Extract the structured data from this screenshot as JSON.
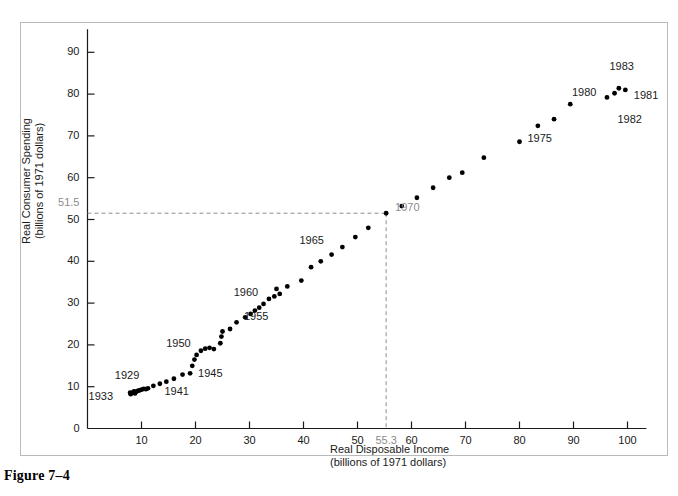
{
  "figure": {
    "caption": "Figure 7–4"
  },
  "axes": {
    "y_title_line1": "Real Consumer Spending",
    "y_title_line2": "(billions of 1971 dollars)",
    "x_title_line1": "Real Disposable Income",
    "x_title_line2": "(billions of 1971 dollars)",
    "y_ticks": [
      "0",
      "10",
      "20",
      "30",
      "40",
      "50",
      "60",
      "70",
      "80",
      "90"
    ],
    "x_ticks": [
      "10",
      "20",
      "30",
      "40",
      "50",
      "60",
      "70",
      "80",
      "90",
      "100"
    ]
  },
  "highlight": {
    "y_value_label": "51.5",
    "x_value_label": "55.3",
    "point_label": "1970",
    "color": "#8c8c8c"
  },
  "point_labels": {
    "y1929": "1929",
    "y1933": "1933",
    "y1941": "1941",
    "y1945": "1945",
    "y1950": "1950",
    "y1955": "1955",
    "y1960": "1960",
    "y1965": "1965",
    "y1975": "1975",
    "y1980": "1980",
    "y1981": "1981",
    "y1982": "1982",
    "y1983": "1983"
  },
  "chart_data": {
    "type": "scatter",
    "title": "Figure 7–4",
    "xlabel": "Real Disposable Income (billions of 1971 dollars)",
    "ylabel": "Real Consumer Spending (billions of 1971 dollars)",
    "xlim": [
      0,
      104
    ],
    "ylim": [
      0,
      95
    ],
    "grid": false,
    "legend": false,
    "marker_color": "#000000",
    "annotations": [
      {
        "text": "1929",
        "x": 9.5,
        "y": 9.2
      },
      {
        "text": "1933",
        "x": 7.6,
        "y": 7.3
      },
      {
        "text": "1941",
        "x": 13.5,
        "y": 10.8
      },
      {
        "text": "1945",
        "x": 19.0,
        "y": 14.0
      },
      {
        "text": "1950",
        "x": 20.5,
        "y": 19.5
      },
      {
        "text": "1955",
        "x": 27.5,
        "y": 26.5
      },
      {
        "text": "1960",
        "x": 33.0,
        "y": 31.5
      },
      {
        "text": "1965",
        "x": 40.0,
        "y": 41.5
      },
      {
        "text": "1970",
        "x": 55.3,
        "y": 51.5
      },
      {
        "text": "1975",
        "x": 80.0,
        "y": 68.5
      },
      {
        "text": "1980",
        "x": 96.0,
        "y": 79.5
      },
      {
        "text": "1981",
        "x": 99.5,
        "y": 80.0
      },
      {
        "text": "1982",
        "x": 98.5,
        "y": 77.0
      },
      {
        "text": "1983",
        "x": 98.5,
        "y": 83.0
      }
    ],
    "reference_lines": [
      {
        "axis": "y",
        "value": 51.5,
        "label": "51.5",
        "style": "dashed"
      },
      {
        "axis": "x",
        "value": 55.3,
        "label": "55.3",
        "style": "dashed"
      }
    ],
    "points": [
      {
        "x": 8.6,
        "y": 8.9
      },
      {
        "x": 9.0,
        "y": 8.8
      },
      {
        "x": 8.3,
        "y": 8.5
      },
      {
        "x": 8.0,
        "y": 8.2
      },
      {
        "x": 7.9,
        "y": 8.6
      },
      {
        "x": 8.8,
        "y": 8.4
      },
      {
        "x": 9.3,
        "y": 9.0
      },
      {
        "x": 9.6,
        "y": 9.1
      },
      {
        "x": 10.0,
        "y": 9.3
      },
      {
        "x": 10.4,
        "y": 9.5
      },
      {
        "x": 10.8,
        "y": 9.4
      },
      {
        "x": 11.2,
        "y": 9.6
      },
      {
        "x": 12.2,
        "y": 10.2
      },
      {
        "x": 13.4,
        "y": 10.7
      },
      {
        "x": 14.6,
        "y": 11.2
      },
      {
        "x": 16.0,
        "y": 11.9
      },
      {
        "x": 17.6,
        "y": 12.9
      },
      {
        "x": 19.0,
        "y": 13.2
      },
      {
        "x": 19.4,
        "y": 15.0
      },
      {
        "x": 19.8,
        "y": 16.5
      },
      {
        "x": 20.2,
        "y": 17.6
      },
      {
        "x": 21.0,
        "y": 18.6
      },
      {
        "x": 21.8,
        "y": 19.1
      },
      {
        "x": 22.6,
        "y": 19.3
      },
      {
        "x": 23.4,
        "y": 19.0
      },
      {
        "x": 24.6,
        "y": 20.4
      },
      {
        "x": 24.8,
        "y": 22.0
      },
      {
        "x": 25.0,
        "y": 23.2
      },
      {
        "x": 26.4,
        "y": 23.8
      },
      {
        "x": 27.6,
        "y": 25.4
      },
      {
        "x": 29.2,
        "y": 26.6
      },
      {
        "x": 30.2,
        "y": 27.4
      },
      {
        "x": 31.0,
        "y": 28.2
      },
      {
        "x": 31.8,
        "y": 28.9
      },
      {
        "x": 32.6,
        "y": 29.8
      },
      {
        "x": 33.6,
        "y": 31.0
      },
      {
        "x": 34.6,
        "y": 31.6
      },
      {
        "x": 35.0,
        "y": 33.4
      },
      {
        "x": 35.6,
        "y": 32.2
      },
      {
        "x": 37.0,
        "y": 34.0
      },
      {
        "x": 39.6,
        "y": 35.4
      },
      {
        "x": 41.4,
        "y": 38.6
      },
      {
        "x": 43.2,
        "y": 40.0
      },
      {
        "x": 45.2,
        "y": 41.6
      },
      {
        "x": 47.2,
        "y": 43.4
      },
      {
        "x": 49.6,
        "y": 45.8
      },
      {
        "x": 52.0,
        "y": 48.0
      },
      {
        "x": 55.3,
        "y": 51.5
      },
      {
        "x": 58.2,
        "y": 53.2
      },
      {
        "x": 61.0,
        "y": 55.2
      },
      {
        "x": 64.0,
        "y": 57.6
      },
      {
        "x": 67.0,
        "y": 60.0
      },
      {
        "x": 69.4,
        "y": 61.2
      },
      {
        "x": 73.4,
        "y": 64.8
      },
      {
        "x": 80.0,
        "y": 68.6
      },
      {
        "x": 83.4,
        "y": 72.4
      },
      {
        "x": 86.4,
        "y": 74.0
      },
      {
        "x": 89.4,
        "y": 77.6
      },
      {
        "x": 96.2,
        "y": 79.2
      },
      {
        "x": 98.4,
        "y": 81.4
      },
      {
        "x": 97.6,
        "y": 80.2
      },
      {
        "x": 99.6,
        "y": 81.0
      }
    ]
  }
}
